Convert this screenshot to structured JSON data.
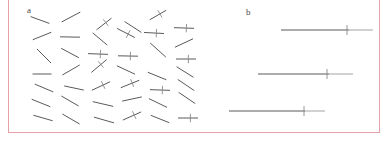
{
  "figure": {
    "width": 386,
    "height": 145,
    "background": "#ffffff",
    "frame": {
      "name": "figure-border",
      "color": "#e8a0a8",
      "left": 8,
      "top": 0,
      "width": 372,
      "height": 133
    }
  },
  "panels": {
    "a": {
      "label": "a",
      "label_x": 19,
      "label_y": 6,
      "description": "randomly oriented line segments, some bearing a short perpendicular cross tick",
      "stroke_color": "#5a5a5a",
      "tick_color": "#8a8a8a"
    },
    "b": {
      "label": "b",
      "label_x": 45,
      "label_y": 8,
      "description": "three horizontal reference lines each crossed by a short vertical tick",
      "stroke_color": "#5a5a5a",
      "tick_color": "#8a8a8a"
    }
  },
  "chart_data": {
    "type": "scatter",
    "title": "",
    "xlabel": "",
    "ylabel": "",
    "panel_a_segments": [
      {
        "cx": 32,
        "cy": 20,
        "len": 20,
        "angle": 20,
        "tick": false
      },
      {
        "cx": 63,
        "cy": 17,
        "len": 21,
        "angle": -28,
        "tick": false
      },
      {
        "cx": 96,
        "cy": 24,
        "len": 19,
        "angle": -38,
        "tick": true
      },
      {
        "cx": 125,
        "cy": 27,
        "len": 20,
        "angle": 33,
        "tick": false
      },
      {
        "cx": 150,
        "cy": 15,
        "len": 19,
        "angle": -30,
        "tick": true
      },
      {
        "cx": 176,
        "cy": 28,
        "len": 20,
        "angle": 2,
        "tick": true
      },
      {
        "cx": 34,
        "cy": 36,
        "len": 20,
        "angle": -22,
        "tick": false
      },
      {
        "cx": 62,
        "cy": 37,
        "len": 20,
        "angle": 1,
        "tick": false
      },
      {
        "cx": 92,
        "cy": 39,
        "len": 19,
        "angle": 40,
        "tick": false
      },
      {
        "cx": 118,
        "cy": 33,
        "len": 20,
        "angle": 27,
        "tick": true
      },
      {
        "cx": 146,
        "cy": 33,
        "len": 20,
        "angle": 3,
        "tick": true
      },
      {
        "cx": 176,
        "cy": 43,
        "len": 20,
        "angle": -25,
        "tick": false
      },
      {
        "cx": 36,
        "cy": 56,
        "len": 20,
        "angle": 45,
        "tick": false
      },
      {
        "cx": 62,
        "cy": 53,
        "len": 20,
        "angle": 28,
        "tick": false
      },
      {
        "cx": 90,
        "cy": 54,
        "len": 20,
        "angle": 2,
        "tick": true
      },
      {
        "cx": 120,
        "cy": 56,
        "len": 20,
        "angle": 1,
        "tick": true
      },
      {
        "cx": 150,
        "cy": 50,
        "len": 21,
        "angle": 42,
        "tick": false
      },
      {
        "cx": 178,
        "cy": 59,
        "len": 20,
        "angle": 0,
        "tick": true
      },
      {
        "cx": 34,
        "cy": 74,
        "len": 19,
        "angle": 0,
        "tick": false
      },
      {
        "cx": 63,
        "cy": 70,
        "len": 20,
        "angle": -30,
        "tick": false
      },
      {
        "cx": 91,
        "cy": 66,
        "len": 20,
        "angle": -40,
        "tick": true
      },
      {
        "cx": 118,
        "cy": 70,
        "len": 20,
        "angle": 25,
        "tick": false
      },
      {
        "cx": 149,
        "cy": 76,
        "len": 20,
        "angle": 22,
        "tick": false
      },
      {
        "cx": 177,
        "cy": 72,
        "len": 20,
        "angle": 32,
        "tick": false
      },
      {
        "cx": 36,
        "cy": 88,
        "len": 20,
        "angle": 23,
        "tick": false
      },
      {
        "cx": 66,
        "cy": 88,
        "len": 20,
        "angle": 12,
        "tick": false
      },
      {
        "cx": 93,
        "cy": 86,
        "len": 20,
        "angle": -25,
        "tick": true
      },
      {
        "cx": 122,
        "cy": 84,
        "len": 20,
        "angle": -22,
        "tick": true
      },
      {
        "cx": 152,
        "cy": 90,
        "len": 20,
        "angle": 2,
        "tick": true
      },
      {
        "cx": 178,
        "cy": 85,
        "len": 20,
        "angle": 34,
        "tick": false
      },
      {
        "cx": 33,
        "cy": 103,
        "len": 20,
        "angle": 22,
        "tick": false
      },
      {
        "cx": 62,
        "cy": 101,
        "len": 20,
        "angle": 30,
        "tick": false
      },
      {
        "cx": 95,
        "cy": 104,
        "len": 21,
        "angle": 13,
        "tick": false
      },
      {
        "cx": 124,
        "cy": 99,
        "len": 20,
        "angle": -12,
        "tick": false
      },
      {
        "cx": 150,
        "cy": 103,
        "len": 20,
        "angle": 26,
        "tick": false
      },
      {
        "cx": 179,
        "cy": 98,
        "len": 20,
        "angle": 34,
        "tick": false
      },
      {
        "cx": 35,
        "cy": 118,
        "len": 20,
        "angle": 16,
        "tick": false
      },
      {
        "cx": 63,
        "cy": 119,
        "len": 20,
        "angle": 30,
        "tick": false
      },
      {
        "cx": 96,
        "cy": 120,
        "len": 21,
        "angle": 16,
        "tick": false
      },
      {
        "cx": 124,
        "cy": 116,
        "len": 20,
        "angle": -24,
        "tick": true
      },
      {
        "cx": 152,
        "cy": 119,
        "len": 20,
        "angle": 22,
        "tick": false
      },
      {
        "cx": 180,
        "cy": 118,
        "len": 20,
        "angle": 0,
        "tick": true
      }
    ],
    "panel_b_lines": [
      {
        "x1": 80,
        "x2": 148,
        "tail_x2": 172,
        "y": 30,
        "tick_x": 146,
        "tick_half": 5
      },
      {
        "x1": 57,
        "x2": 128,
        "tail_x2": 152,
        "y": 74,
        "tick_x": 126,
        "tick_half": 5
      },
      {
        "x1": 28,
        "x2": 104,
        "tail_x2": 124,
        "y": 111,
        "tick_x": 103,
        "tick_half": 5
      }
    ]
  }
}
